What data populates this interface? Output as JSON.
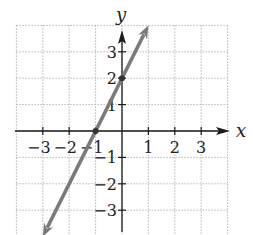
{
  "chart_data": {
    "type": "line",
    "title": "",
    "xlabel": "x",
    "ylabel": "y",
    "xlim": [
      -4,
      4
    ],
    "ylim": [
      -4,
      4
    ],
    "grid": true,
    "x_ticks": [
      -3,
      -2,
      -1,
      1,
      2,
      3
    ],
    "y_ticks": [
      -3,
      -2,
      -1,
      1,
      2,
      3
    ],
    "x_tick_labels": [
      "−3",
      "−2",
      "−1",
      "1",
      "2",
      "3"
    ],
    "y_tick_labels": [
      "−3",
      "−2",
      "−1",
      "1",
      "2",
      "3"
    ],
    "series": [
      {
        "name": "y = 2x + 2",
        "equation": "y = 2x + 2",
        "slope": 2,
        "intercept": 2,
        "x": [
          -3.0,
          1.0
        ],
        "y": [
          -4.0,
          4.0
        ],
        "marked_points": [
          [
            -1,
            0
          ],
          [
            0,
            2
          ]
        ],
        "color": "#7a7a7a",
        "arrows_both_ends": true
      }
    ]
  },
  "axes": {
    "x_label": "x",
    "y_label": "y"
  },
  "colors": {
    "line": "#7a7a7a",
    "axis": "#1a1a1a",
    "grid": "#b5b5b5"
  }
}
